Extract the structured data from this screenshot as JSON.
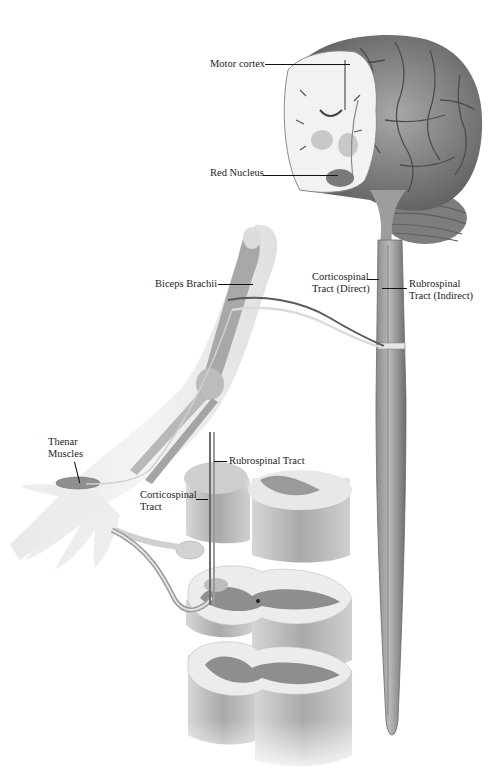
{
  "figure": {
    "type": "anatomical illustration",
    "colors": {
      "background": "#ffffff",
      "tissue_dark": "#6e6e6e",
      "tissue_mid": "#9a9a9a",
      "tissue_light": "#d8d8d8",
      "white_matter": "#efefef",
      "label_text": "#1c1c1c"
    }
  },
  "labels": {
    "motor_cortex": "Motor cortex",
    "red_nucleus": "Red Nucleus",
    "biceps_brachii": "Biceps Brachii",
    "corticospinal_direct_line1": "Corticospinal",
    "corticospinal_direct_line2": "Tract (Direct)",
    "rubrospinal_indirect_line1": "Rubrospinal",
    "rubrospinal_indirect_line2": "Tract (Indirect)",
    "thenar_line1": "Thenar",
    "thenar_line2": "Muscles",
    "rubrospinal_tract": "Rubrospinal Tract",
    "corticospinal_tract_line1": "Corticospinal",
    "corticospinal_tract_line2": "Tract"
  }
}
